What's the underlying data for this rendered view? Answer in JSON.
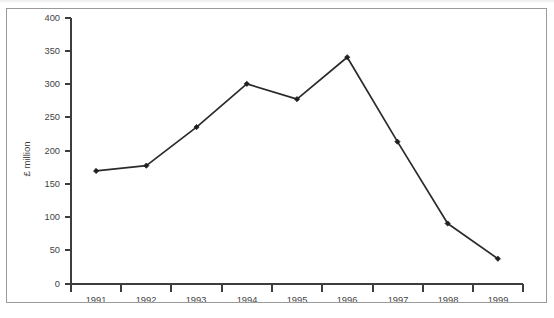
{
  "figure": {
    "background_color": "#ffffff",
    "frame_color": "#9a9a9a",
    "line_color": "#2b2b2b",
    "marker_color": "#1f1f1f",
    "axis_color": "#3d3d3d",
    "text_color": "#444444"
  },
  "chart_data": {
    "type": "line",
    "title": "",
    "subtitle": "",
    "xlabel": "",
    "ylabel": "£ million",
    "categories": [
      "1991",
      "1992",
      "1993",
      "1994",
      "1995",
      "1996",
      "1997",
      "1998",
      "1999"
    ],
    "values": [
      170,
      178,
      236,
      301,
      278,
      341,
      214,
      91,
      38
    ],
    "series": [
      {
        "name": "£ million",
        "values": [
          170,
          178,
          236,
          301,
          278,
          341,
          214,
          91,
          38
        ]
      }
    ],
    "ylim": [
      0,
      400
    ],
    "yticks": [
      0,
      50,
      100,
      150,
      200,
      250,
      300,
      350,
      400
    ],
    "ytick_labels": [
      "0",
      "50",
      "100",
      "150",
      "200",
      "250",
      "300",
      "350",
      "400"
    ],
    "xtick_labels": [
      "1991",
      "1992",
      "1993",
      "1994",
      "1995",
      "1996",
      "1997",
      "1998",
      "1999"
    ],
    "grid": false,
    "legend": false,
    "legend_position": "none",
    "marker": "diamond",
    "annotations": []
  }
}
